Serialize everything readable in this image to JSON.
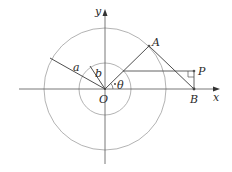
{
  "diagram": {
    "type": "geometry",
    "colors": {
      "circle": "#9a9a9a",
      "axis": "#555555",
      "segment": "#3a3a3a",
      "point": "#555555",
      "text": "#2a2a2a"
    },
    "labels": {
      "y_axis": "y",
      "x_axis": "x",
      "origin": "O",
      "point_a": "A",
      "point_b": "B",
      "point_p": "P",
      "radius_a": "a",
      "radius_b": "b",
      "angle": "θ"
    },
    "geometry": {
      "origin": [
        105,
        89
      ],
      "outer_radius": 61,
      "inner_radius": 26,
      "A": [
        149,
        46
      ],
      "B": [
        194,
        89
      ],
      "P": [
        194,
        71
      ],
      "OA_inner_intersection": [
        123,
        71
      ],
      "a_endpoint": [
        50,
        58
      ],
      "b_endpoint": [
        90,
        66
      ]
    }
  }
}
